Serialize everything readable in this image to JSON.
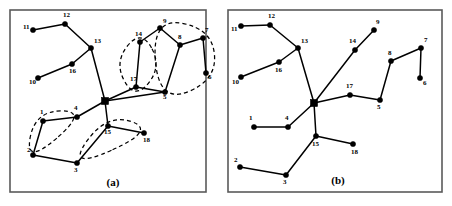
{
  "figure": {
    "width": 452,
    "height": 206,
    "background": "#ffffff"
  },
  "colors": {
    "node": "#000000",
    "edge": "#000000",
    "cluster_outline": "#000000",
    "frame": "#5a5a5a",
    "background": "#ffffff"
  },
  "chart_data": {
    "type": "diagram",
    "title": "",
    "xlabel": "",
    "ylabel": "",
    "grid": false,
    "legend": "none",
    "panels": [
      {
        "id": "a",
        "caption": "(a)",
        "caption_x": 113,
        "caption_y": 186,
        "frame": {
          "x": 10,
          "y": 10,
          "width": 196,
          "height": 182
        },
        "has_clusters": true,
        "hub": {
          "id": "hub",
          "label": "",
          "x": 105,
          "y": 101,
          "shape": "square",
          "size": 7
        },
        "nodes": [
          {
            "id": "11",
            "label": "11",
            "x": 33,
            "y": 30,
            "lx": 23,
            "ly": 29
          },
          {
            "id": "12",
            "label": "12",
            "x": 65,
            "y": 24,
            "lx": 63,
            "ly": 17
          },
          {
            "id": "13",
            "label": "13",
            "x": 91,
            "y": 48,
            "lx": 94,
            "ly": 43
          },
          {
            "id": "16",
            "label": "16",
            "x": 72,
            "y": 64,
            "lx": 69,
            "ly": 73
          },
          {
            "id": "10",
            "label": "10",
            "x": 38,
            "y": 78,
            "lx": 29,
            "ly": 84
          },
          {
            "id": "14",
            "label": "14",
            "x": 140,
            "y": 42,
            "lx": 135,
            "ly": 36
          },
          {
            "id": "9",
            "label": "9",
            "x": 160,
            "y": 28,
            "lx": 163,
            "ly": 23
          },
          {
            "id": "8",
            "label": "8",
            "x": 180,
            "y": 45,
            "lx": 178,
            "ly": 39
          },
          {
            "id": "7",
            "label": "7",
            "x": 203,
            "y": 38,
            "lx": 205,
            "ly": 32
          },
          {
            "id": "6",
            "label": "6",
            "x": 206,
            "y": 73,
            "lx": 208,
            "ly": 79
          },
          {
            "id": "17",
            "label": "17",
            "x": 136,
            "y": 87,
            "lx": 130,
            "ly": 81
          },
          {
            "id": "5",
            "label": "5",
            "x": 165,
            "y": 92,
            "lx": 163,
            "ly": 99
          },
          {
            "id": "1",
            "label": "1",
            "x": 43,
            "y": 121,
            "lx": 40,
            "ly": 114
          },
          {
            "id": "4",
            "label": "4",
            "x": 77,
            "y": 117,
            "lx": 74,
            "ly": 110
          },
          {
            "id": "2",
            "label": "2",
            "x": 33,
            "y": 155,
            "lx": 27,
            "ly": 152
          },
          {
            "id": "3",
            "label": "3",
            "x": 77,
            "y": 163,
            "lx": 74,
            "ly": 172
          },
          {
            "id": "15",
            "label": "15",
            "x": 108,
            "y": 126,
            "lx": 104,
            "ly": 134
          },
          {
            "id": "18",
            "label": "18",
            "x": 144,
            "y": 133,
            "lx": 143,
            "ly": 142
          }
        ],
        "edges": [
          [
            "11",
            "12"
          ],
          [
            "12",
            "13"
          ],
          [
            "13",
            "16"
          ],
          [
            "16",
            "10"
          ],
          [
            "13",
            "hub"
          ],
          [
            "hub",
            "17"
          ],
          [
            "17",
            "14"
          ],
          [
            "14",
            "9"
          ],
          [
            "9",
            "8"
          ],
          [
            "8",
            "7"
          ],
          [
            "7",
            "6"
          ],
          [
            "8",
            "5"
          ],
          [
            "17",
            "5"
          ],
          [
            "hub",
            "5"
          ],
          [
            "hub",
            "4"
          ],
          [
            "4",
            "1"
          ],
          [
            "1",
            "2"
          ],
          [
            "2",
            "3"
          ],
          [
            "3",
            "15"
          ],
          [
            "hub",
            "15"
          ],
          [
            "15",
            "18"
          ]
        ],
        "clusters": [
          {
            "id": "cluster-upper-left",
            "members": [
              "14",
              "17"
            ]
          },
          {
            "id": "cluster-upper-right",
            "members": [
              "9",
              "8",
              "7",
              "6",
              "5"
            ]
          },
          {
            "id": "cluster-lower-left",
            "members": [
              "1",
              "4",
              "2"
            ]
          },
          {
            "id": "cluster-lower-right",
            "members": [
              "3",
              "15",
              "18"
            ]
          }
        ]
      },
      {
        "id": "b",
        "caption": "(b)",
        "caption_x": 338,
        "caption_y": 184,
        "frame": {
          "x": 228,
          "y": 10,
          "width": 214,
          "height": 182
        },
        "has_clusters": false,
        "hub": {
          "id": "hub",
          "label": "",
          "x": 314,
          "y": 103,
          "shape": "square",
          "size": 7
        },
        "nodes": [
          {
            "id": "11",
            "label": "11",
            "x": 241,
            "y": 26,
            "lx": 231,
            "ly": 31
          },
          {
            "id": "12",
            "label": "12",
            "x": 270,
            "y": 25,
            "lx": 268,
            "ly": 18
          },
          {
            "id": "13",
            "label": "13",
            "x": 298,
            "y": 48,
            "lx": 301,
            "ly": 43
          },
          {
            "id": "16",
            "label": "16",
            "x": 279,
            "y": 62,
            "lx": 275,
            "ly": 72
          },
          {
            "id": "10",
            "label": "10",
            "x": 241,
            "y": 77,
            "lx": 232,
            "ly": 84
          },
          {
            "id": "14",
            "label": "14",
            "x": 355,
            "y": 50,
            "lx": 349,
            "ly": 43
          },
          {
            "id": "9",
            "label": "9",
            "x": 374,
            "y": 30,
            "lx": 376,
            "ly": 24
          },
          {
            "id": "8",
            "label": "8",
            "x": 391,
            "y": 61,
            "lx": 388,
            "ly": 55
          },
          {
            "id": "7",
            "label": "7",
            "x": 421,
            "y": 48,
            "lx": 424,
            "ly": 42
          },
          {
            "id": "6",
            "label": "6",
            "x": 420,
            "y": 78,
            "lx": 423,
            "ly": 85
          },
          {
            "id": "17",
            "label": "17",
            "x": 350,
            "y": 95,
            "lx": 346,
            "ly": 88
          },
          {
            "id": "5",
            "label": "5",
            "x": 380,
            "y": 100,
            "lx": 377,
            "ly": 109
          },
          {
            "id": "1",
            "label": "1",
            "x": 254,
            "y": 127,
            "lx": 249,
            "ly": 120
          },
          {
            "id": "4",
            "label": "4",
            "x": 288,
            "y": 127,
            "lx": 285,
            "ly": 120
          },
          {
            "id": "2",
            "label": "2",
            "x": 240,
            "y": 167,
            "lx": 234,
            "ly": 162
          },
          {
            "id": "3",
            "label": "3",
            "x": 286,
            "y": 175,
            "lx": 283,
            "ly": 184
          },
          {
            "id": "15",
            "label": "15",
            "x": 316,
            "y": 136,
            "lx": 312,
            "ly": 146
          },
          {
            "id": "18",
            "label": "18",
            "x": 353,
            "y": 144,
            "lx": 351,
            "ly": 154
          }
        ],
        "edges": [
          [
            "11",
            "12"
          ],
          [
            "12",
            "13"
          ],
          [
            "13",
            "16"
          ],
          [
            "16",
            "10"
          ],
          [
            "13",
            "hub"
          ],
          [
            "hub",
            "17"
          ],
          [
            "hub",
            "14"
          ],
          [
            "14",
            "9"
          ],
          [
            "17",
            "5"
          ],
          [
            "5",
            "8"
          ],
          [
            "8",
            "7"
          ],
          [
            "7",
            "6"
          ],
          [
            "hub",
            "4"
          ],
          [
            "4",
            "1"
          ],
          [
            "hub",
            "15"
          ],
          [
            "15",
            "3"
          ],
          [
            "3",
            "2"
          ],
          [
            "15",
            "18"
          ]
        ],
        "clusters": []
      }
    ]
  }
}
